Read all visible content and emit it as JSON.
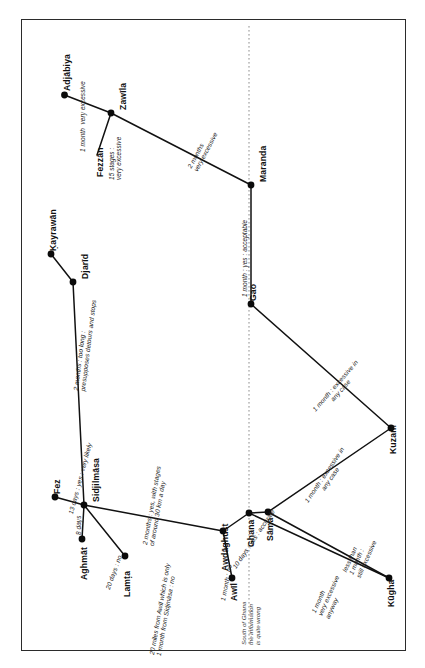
{
  "diagram": {
    "type": "node-link diagram",
    "orientation": "text rotated 90 degrees counter-clockwise",
    "border_color": "#2b2b2b",
    "node_color": "#0b0b0b",
    "edge_color": "#111111",
    "divider_color": "#8d8d8d"
  },
  "cities": [
    {
      "id": "adjabiya",
      "label": "Adjābiya"
    },
    {
      "id": "zawila",
      "label": "Zawīla"
    },
    {
      "id": "fezzan",
      "label": "Fezzān"
    },
    {
      "id": "maranda",
      "label": "Maranda"
    },
    {
      "id": "kayrawan",
      "label": "Ḳayrawān"
    },
    {
      "id": "djarid",
      "label": "Djarīd"
    },
    {
      "id": "gao",
      "label": "Gao"
    },
    {
      "id": "fez",
      "label": "Fez"
    },
    {
      "id": "sidjilmasa",
      "label": "Sidjilmāsa"
    },
    {
      "id": "aghmat",
      "label": "Aghmāt"
    },
    {
      "id": "lamta",
      "label": "Lamṭa"
    },
    {
      "id": "awdaghust",
      "label": "Awdāghust"
    },
    {
      "id": "ghana",
      "label": "Ghana"
    },
    {
      "id": "sama",
      "label": "Sāma"
    },
    {
      "id": "awil",
      "label": "Awīl"
    },
    {
      "id": "kuzam",
      "label": "Kuzam"
    },
    {
      "id": "kugha",
      "label": "Kūgha"
    }
  ],
  "annotations": [
    {
      "id": "adjabiya-zawila",
      "line1": "1 month",
      "line2": "very excessive"
    },
    {
      "id": "fezzan-zawila",
      "line1": "15 stages :",
      "line2": "very excessive"
    },
    {
      "id": "zawila-maranda",
      "line1": "2 months",
      "line2": "very excessive"
    },
    {
      "id": "kayrawan-djarid",
      "line1": "2 months : too long :",
      "line2": "presupposes detours and stops"
    },
    {
      "id": "maranda-gao",
      "line1": "1 month : yes : acceptable",
      "line2": ""
    },
    {
      "id": "gao-kuzam",
      "line1": "1 month : excessive in",
      "line2": "any case"
    },
    {
      "id": "fez-sidjilmasa",
      "line1": "13 days : yes : very likely",
      "line2": ""
    },
    {
      "id": "sidjilmasa-aghmat",
      "line1": "8 days",
      "line2": ""
    },
    {
      "id": "sidjilmasa-lamta",
      "line1": "20 days : no",
      "line2": ""
    },
    {
      "id": "sidjilmasa-awdaghust",
      "line1": "2 months : yes, with stages",
      "line2": "of around 30 km a day"
    },
    {
      "id": "lamta-awil",
      "line1": "20 miles from Awīl which is only",
      "line2": "1 month from Sidjmāsa : no"
    },
    {
      "id": "awdaghust-ghana",
      "line1": "10 days : yes : accurate",
      "line2": ""
    },
    {
      "id": "awil-awdaghust",
      "line1": "1 month : no",
      "line2": ""
    },
    {
      "id": "sama-kuzam",
      "line1": "1 month : excessive in",
      "line2": "any case"
    },
    {
      "id": "ghana-kugha",
      "line1": "1 month",
      "line2": "very excessive",
      "line3": "anyway"
    },
    {
      "id": "sama-kugha",
      "line1": "less than",
      "line2": "1 month :",
      "line3": "still excessive"
    }
  ],
  "notes": [
    {
      "id": "south-of-ghana",
      "line1": "South of Ghana",
      "line2": "the information",
      "line3": "is quite wrong"
    }
  ]
}
